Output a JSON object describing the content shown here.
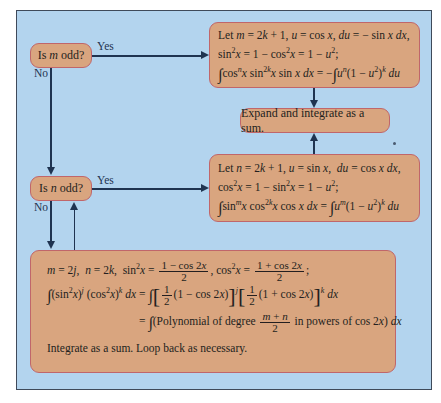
{
  "diagram": {
    "type": "flowchart",
    "colors": {
      "background": "#b3d4ee",
      "box_fill": "#d9a57f",
      "box_border": "#c0666a",
      "arrow": "#1f3350"
    },
    "decisions": [
      {
        "id": "m_odd",
        "label_prefix": "Is ",
        "var": "m",
        "label_suffix": " odd?"
      },
      {
        "id": "n_odd",
        "label_prefix": "Is ",
        "var": "n",
        "label_suffix": " odd?"
      }
    ],
    "edge_labels": {
      "yes": "Yes",
      "no": "No"
    },
    "box_m_odd": {
      "line1": "Let m = 2k + 1, u = cos x, du = − sin x dx,",
      "line2": "sin²x = 1 − cos²x = 1 − u²;",
      "line3": "∫cosⁿx sin²ᵏx sin x dx = −∫uⁿ(1 − u²)ᵏ du"
    },
    "box_expand": {
      "label": "Expand and integrate as a sum."
    },
    "box_n_odd": {
      "line1": "Let n = 2k + 1, u = sin x,  du = cos x dx,",
      "line2": "cos²x = 1 − sin²x = 1 − u²;",
      "line3": "∫sinᵐx cos²ᵏx cos x dx = ∫uᵐ(1 − u²)ᵏ du"
    },
    "box_even": {
      "line1": "m = 2j,  n = 2k,  sin²x = (1 − cos 2x)/2,  cos²x = (1 + cos 2x)/2;",
      "line2": "∫(sin²x)ʲ (cos²x)ᵏ dx = ∫[½(1 − cos 2x)]ʲ[½(1 + cos 2x)]ᵏ dx",
      "line3": "= ∫(Polynomial of degree (m + n)/2 in powers of cos 2x) dx",
      "line4": "Integrate as a sum. Loop back as necessary."
    }
  }
}
